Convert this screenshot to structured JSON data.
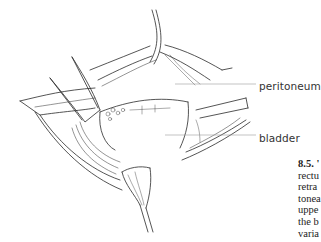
{
  "figure": {
    "labels": [
      {
        "id": "peritoneum",
        "text": "peritoneum"
      },
      {
        "id": "bladder",
        "text": "bladder"
      }
    ]
  },
  "caption": {
    "number": "8.5.",
    "lines": [
      "8.5. '",
      "rectu",
      "retra",
      "tonea",
      "uppe",
      "the b",
      "varia"
    ]
  },
  "colors": {
    "line": "#2a2a2a",
    "leader": "#9a9a9a",
    "background": "#ffffff"
  }
}
